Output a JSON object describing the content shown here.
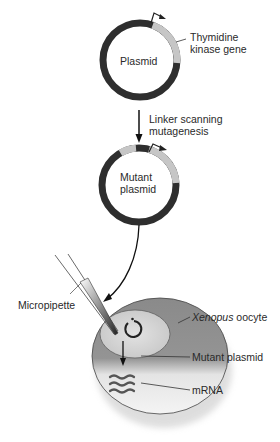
{
  "diagram": {
    "plasmid": {
      "label": "Plasmid"
    },
    "gene": {
      "label_line1": "Thymidine",
      "label_line2": "kinase gene"
    },
    "step": {
      "label_line1": "Linker scanning",
      "label_line2": "mutagenesis"
    },
    "mutant_plasmid": {
      "label_line1": "Mutant",
      "label_line2": "plasmid"
    },
    "micropipette": {
      "label": "Micropipette"
    },
    "oocyte": {
      "label_italic": "Xenopus",
      "label_rest": " oocyte"
    },
    "nucleus_plasmid": {
      "label": "Mutant plasmid"
    },
    "mrna": {
      "label": "mRNA"
    },
    "colors": {
      "plasmid_dark": "#2e2e2e",
      "gene_gray": "#c4c4c4",
      "oocyte_dark": "#8c8c8c",
      "oocyte_light": "#f0f0f0",
      "nucleus": "#cfcfcf"
    }
  }
}
